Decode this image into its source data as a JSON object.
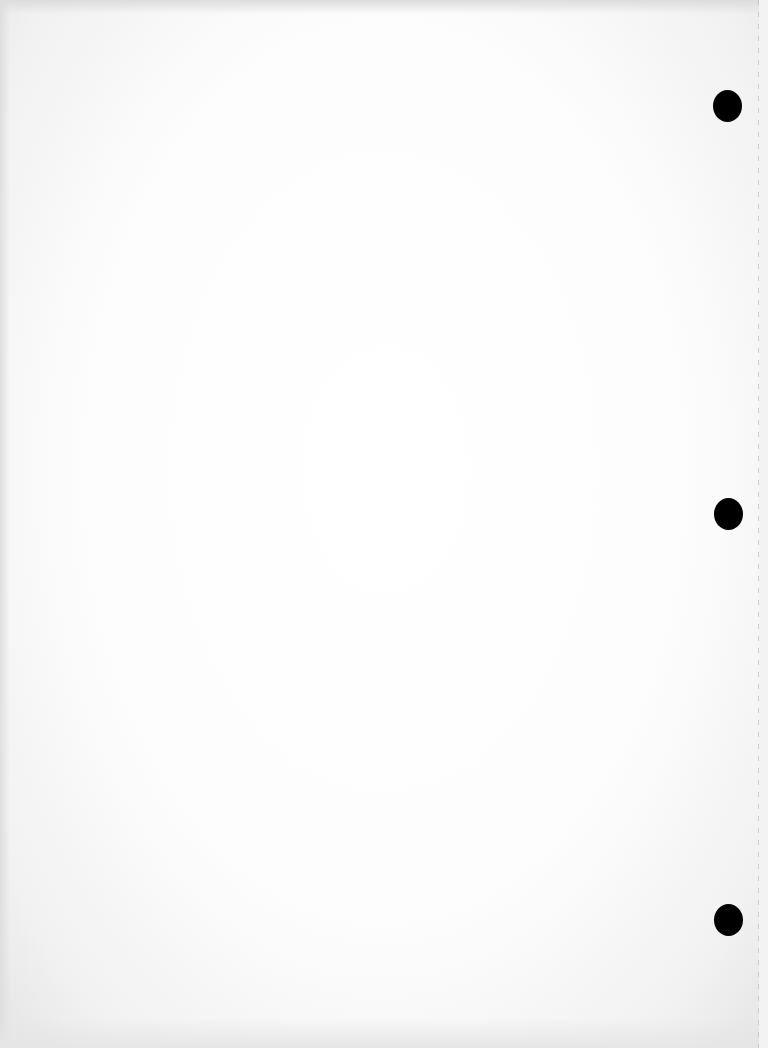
{
  "document": {
    "type": "blank scanned sheet",
    "text_content": "",
    "punch_holes": [
      {
        "cx": 727,
        "cy": 106
      },
      {
        "cx": 728,
        "cy": 514
      },
      {
        "cx": 728,
        "cy": 920
      }
    ],
    "colors": {
      "paper": "#ffffff",
      "edge_shadow": "#e4e4e4",
      "hole": "#000000",
      "fold_line": "#bdbdbd"
    }
  }
}
